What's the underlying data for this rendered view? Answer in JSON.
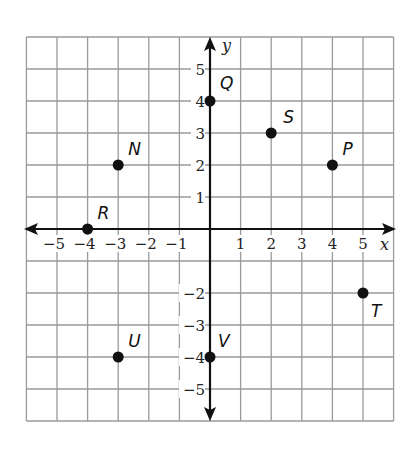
{
  "chart_data": {
    "type": "scatter",
    "title": "",
    "xlabel": "x",
    "ylabel": "y",
    "xlim": [
      -6,
      6
    ],
    "ylim": [
      -6,
      6
    ],
    "grid": true,
    "x_ticks": [
      -5,
      -4,
      -3,
      -2,
      -1,
      1,
      2,
      3,
      4,
      5
    ],
    "y_ticks": [
      -5,
      -4,
      -3,
      -2,
      1,
      2,
      3,
      4,
      5
    ],
    "x_tick_labels": [
      "−5",
      "−4",
      "−3",
      "−2",
      "−1",
      "1",
      "2",
      "3",
      "4",
      "5"
    ],
    "y_tick_labels": [
      "−5",
      "−4",
      "−3",
      "−2",
      "1",
      "2",
      "3",
      "4",
      "5"
    ],
    "points": [
      {
        "label": "Q",
        "x": 0,
        "y": 4
      },
      {
        "label": "S",
        "x": 2,
        "y": 3
      },
      {
        "label": "P",
        "x": 4,
        "y": 2
      },
      {
        "label": "N",
        "x": -3,
        "y": 2
      },
      {
        "label": "R",
        "x": -4,
        "y": 0
      },
      {
        "label": "T",
        "x": 5,
        "y": -2
      },
      {
        "label": "U",
        "x": -3,
        "y": -4
      },
      {
        "label": "V",
        "x": 0,
        "y": -4
      }
    ]
  },
  "axes": {
    "x_name": "x",
    "y_name": "y"
  },
  "colors": {
    "grid": "#9a9a9a",
    "axis": "#111111",
    "point": "#111111",
    "background": "#ffffff"
  }
}
